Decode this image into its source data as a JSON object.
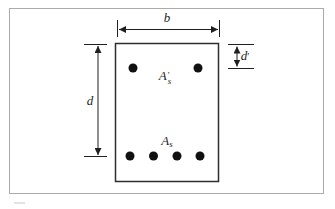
{
  "figure": {
    "kind": "doubly-reinforced-beam-cross-section",
    "dimensions": {
      "width_label": "b",
      "depth_label": "d",
      "cover_label_base": "d",
      "cover_label_prime": "′"
    },
    "steel": {
      "compression_base": "A",
      "compression_prime": "′",
      "compression_sub": "s",
      "tension_base": "A",
      "tension_sub": "s"
    },
    "rebar": {
      "top_count": 2,
      "bottom_count": 4
    },
    "colors": {
      "background": "#ffffff",
      "frame_border": "#ababab",
      "line": "#1f1f1f",
      "beam_outline": "#2e2e2e",
      "rebar_dot": "#111111",
      "artifact": "#d9d9d9"
    }
  }
}
